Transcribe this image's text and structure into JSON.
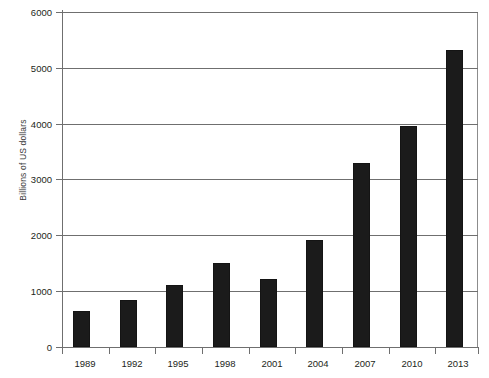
{
  "chart_data": {
    "type": "bar",
    "title": "",
    "subtitle": "",
    "xlabel": "",
    "ylabel": "Billions of US dollars",
    "categories": [
      "1989",
      "1992",
      "1995",
      "1998",
      "2001",
      "2004",
      "2007",
      "2010",
      "2013"
    ],
    "values": [
      650,
      840,
      1110,
      1500,
      1220,
      1920,
      3300,
      3950,
      5320
    ],
    "ylim": [
      0,
      6000
    ],
    "ytick_labels": [
      "0",
      "1000",
      "2000",
      "3000",
      "4000",
      "5000",
      "6000"
    ],
    "ytick_values": [
      0,
      1000,
      2000,
      3000,
      4000,
      5000,
      6000
    ],
    "grid": true,
    "legend": "none",
    "bar_color": "#1b1b1b",
    "axis_color": "#6f6f6f",
    "text_color": "#231f20"
  }
}
